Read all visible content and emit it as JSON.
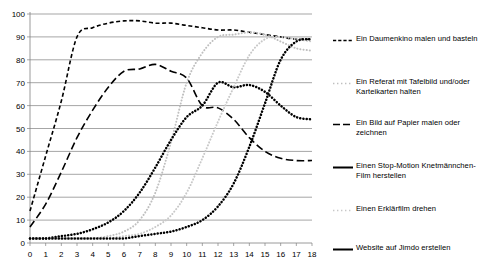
{
  "chart_data": {
    "type": "line",
    "title": "",
    "xlabel": "",
    "ylabel": "",
    "xlim": [
      0,
      18
    ],
    "ylim": [
      0,
      100
    ],
    "ytick_labels": [
      "0",
      "10",
      "20",
      "30",
      "40",
      "50",
      "60",
      "70",
      "80",
      "90",
      "100"
    ],
    "yticks": [
      0,
      10,
      20,
      30,
      40,
      50,
      60,
      70,
      80,
      90,
      100
    ],
    "xtick_labels": [
      "0",
      "1",
      "2",
      "3",
      "4",
      "5",
      "6",
      "7",
      "8",
      "9",
      "10",
      "11",
      "12",
      "13",
      "14",
      "15",
      "16",
      "17",
      "18"
    ],
    "xticks": [
      0,
      1,
      2,
      3,
      4,
      5,
      6,
      7,
      8,
      9,
      10,
      11,
      12,
      13,
      14,
      15,
      16,
      17,
      18
    ],
    "grid": "horizontal",
    "legend_position": "right",
    "x": [
      0,
      1,
      2,
      3,
      4,
      5,
      6,
      7,
      8,
      9,
      10,
      11,
      12,
      13,
      14,
      15,
      16,
      17,
      18
    ],
    "series": [
      {
        "name": "Ein Daumenkino malen und basteln",
        "style": "dashed",
        "color": "#000000",
        "values": [
          14,
          38,
          62,
          90,
          94,
          96,
          97,
          97,
          96,
          96,
          95,
          94,
          93,
          93,
          92,
          91,
          90,
          89,
          89
        ]
      },
      {
        "name": "Ein Referat mit Tafelbild und/oder Karteikarten halten",
        "style": "dotted-light",
        "color": "#bfbfbf",
        "values": [
          2,
          2,
          2,
          2,
          2,
          3,
          5,
          10,
          22,
          44,
          70,
          83,
          90,
          91,
          92,
          91,
          88,
          85,
          84
        ]
      },
      {
        "name": "Ein Bild auf Papier malen oder zeichnen",
        "style": "dashed-long",
        "color": "#000000",
        "values": [
          7,
          17,
          31,
          46,
          58,
          68,
          75,
          76,
          78,
          75,
          72,
          60,
          59,
          54,
          46,
          40,
          37,
          36,
          36
        ]
      },
      {
        "name": "Einen Stop-Motion Knetmännchen-Film herstellen",
        "style": "dotted-heavy",
        "color": "#000000",
        "values": [
          2,
          2,
          3,
          4,
          6,
          9,
          14,
          22,
          33,
          45,
          55,
          60,
          70,
          68,
          69,
          66,
          60,
          55,
          54
        ]
      },
      {
        "name": "Einen Erklärfilm drehen",
        "style": "dotted-light",
        "color": "#c8c8c8",
        "values": [
          2,
          2,
          2,
          2,
          2,
          2,
          3,
          4,
          7,
          12,
          22,
          37,
          53,
          68,
          82,
          89,
          90,
          89,
          88
        ]
      },
      {
        "name": "Website auf Jimdo erstellen",
        "style": "dotted-heavy",
        "color": "#000000",
        "values": [
          2,
          2,
          2,
          2,
          2,
          2,
          2,
          3,
          4,
          5,
          7,
          10,
          16,
          26,
          42,
          61,
          80,
          88,
          89
        ]
      }
    ]
  },
  "legend": {
    "items": [
      {
        "label": "Ein Daumenkino malen und basteln"
      },
      {
        "label": "Ein Referat mit Tafelbild und/oder Karteikarten halten"
      },
      {
        "label": "Ein Bild auf Papier malen oder zeichnen"
      },
      {
        "label": "Einen Stop-Motion Knetmännchen-Film herstellen"
      },
      {
        "label": "Einen Erklärfilm drehen"
      },
      {
        "label": "Website auf Jimdo erstellen"
      }
    ]
  }
}
